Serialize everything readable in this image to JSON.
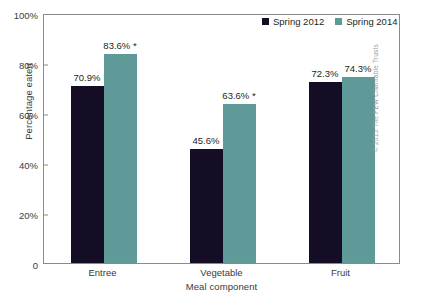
{
  "chart_data": {
    "type": "bar",
    "title": "",
    "xlabel": "Meal component",
    "ylabel": "Percentage eaten",
    "categories": [
      "Entree",
      "Vegetable",
      "Fruit"
    ],
    "series": [
      {
        "name": "Spring 2012",
        "color": "#150d26",
        "values": [
          70.9,
          45.6,
          72.3
        ],
        "labels": [
          "70.9%",
          "45.6%",
          "72.3%"
        ]
      },
      {
        "name": "Spring 2014",
        "color": "#5f9a99",
        "values": [
          83.6,
          63.6,
          74.3
        ],
        "labels": [
          "83.6% *",
          "63.6% *",
          "74.3%"
        ]
      }
    ],
    "ylim": [
      0,
      100
    ],
    "yticks": [
      0,
      20,
      40,
      60,
      80,
      100
    ],
    "ytick_labels": [
      "0",
      "20%",
      "40%",
      "60%",
      "80%",
      "100%"
    ],
    "grid": false,
    "legend_position": "top-right",
    "annotation": "* denotes statistically significant difference"
  },
  "legend": {
    "items": [
      {
        "label": "Spring 2012",
        "color": "#150d26"
      },
      {
        "label": "Spring 2014",
        "color": "#5f9a99"
      }
    ]
  },
  "credit": "© 2015 The PEW Charitable Trusts"
}
